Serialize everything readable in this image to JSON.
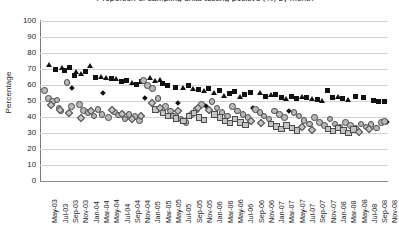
{
  "chart_data": {
    "type": "scatter",
    "title": "Proportion of sampling units testing positive (%) by month",
    "xlabel": "",
    "ylabel": "Percentage",
    "ylim": [
      0,
      100
    ],
    "ytick_step": 10,
    "yticks": [
      "100",
      "90",
      "80",
      "70",
      "60",
      "50",
      "40",
      "30",
      "20",
      "10",
      "0"
    ],
    "grid": true,
    "legend_position": "none",
    "x_range": [
      "May-03",
      "Nov-08"
    ],
    "xticks": [
      "May-03",
      "Jul-03",
      "Sep-03",
      "Nov-03",
      "Jan-04",
      "Mar-04",
      "May-04",
      "Jul-04",
      "Sep-04",
      "Nov-04",
      "Jan-05",
      "Mar-05",
      "May-05",
      "Jul-05",
      "Sep-05",
      "Nov-05",
      "Jan-06",
      "Mar-06",
      "May-06",
      "Jul-06",
      "Sep-06",
      "Nov-06",
      "Jan-07",
      "Mar-07",
      "May-07",
      "Jul-07",
      "Sep-07",
      "Nov-07",
      "Jan-08",
      "Mar-08",
      "May-08",
      "Jul-08",
      "Sep-08",
      "Nov-08"
    ],
    "series": [
      {
        "name": "series-triangle-black",
        "marker": "triangle",
        "color": "#111111",
        "points": [
          {
            "x": 1.0,
            "y": 72.0
          },
          {
            "x": 3.6,
            "y": 70.5
          },
          {
            "x": 6.3,
            "y": 68.0
          },
          {
            "x": 7.2,
            "y": 66.5
          },
          {
            "x": 9.0,
            "y": 71.5
          },
          {
            "x": 11.0,
            "y": 65.0
          },
          {
            "x": 12.0,
            "y": 64.0
          },
          {
            "x": 14.0,
            "y": 63.5
          },
          {
            "x": 17.0,
            "y": 61.0
          },
          {
            "x": 20.5,
            "y": 64.0
          },
          {
            "x": 21.5,
            "y": 62.5
          },
          {
            "x": 22.5,
            "y": 63.0
          },
          {
            "x": 27.0,
            "y": 58.0
          },
          {
            "x": 29.0,
            "y": 57.5
          },
          {
            "x": 31.0,
            "y": 56.0
          },
          {
            "x": 33.0,
            "y": 55.0
          },
          {
            "x": 35.0,
            "y": 53.0
          },
          {
            "x": 38.0,
            "y": 52.5
          },
          {
            "x": 42.0,
            "y": 55.0
          },
          {
            "x": 44.0,
            "y": 53.5
          },
          {
            "x": 47.0,
            "y": 51.0
          },
          {
            "x": 50.0,
            "y": 52.0
          },
          {
            "x": 52.0,
            "y": 51.0
          },
          {
            "x": 54.0,
            "y": 50.0
          },
          {
            "x": 57.0,
            "y": 52.5
          },
          {
            "x": 59.0,
            "y": 50.5
          }
        ]
      },
      {
        "name": "series-square-black",
        "marker": "square",
        "color": "#111111",
        "points": [
          {
            "x": 2.2,
            "y": 70.0
          },
          {
            "x": 4.0,
            "y": 69.0
          },
          {
            "x": 5.0,
            "y": 71.0
          },
          {
            "x": 6.0,
            "y": 66.0
          },
          {
            "x": 8.0,
            "y": 68.5
          },
          {
            "x": 10.0,
            "y": 65.0
          },
          {
            "x": 13.0,
            "y": 64.0
          },
          {
            "x": 15.0,
            "y": 62.0
          },
          {
            "x": 16.0,
            "y": 63.0
          },
          {
            "x": 18.0,
            "y": 60.5
          },
          {
            "x": 19.0,
            "y": 62.0
          },
          {
            "x": 23.0,
            "y": 61.0
          },
          {
            "x": 24.0,
            "y": 59.5
          },
          {
            "x": 25.5,
            "y": 58.5
          },
          {
            "x": 28.0,
            "y": 60.0
          },
          {
            "x": 30.0,
            "y": 57.0
          },
          {
            "x": 32.0,
            "y": 58.0
          },
          {
            "x": 34.0,
            "y": 56.5
          },
          {
            "x": 36.0,
            "y": 55.0
          },
          {
            "x": 37.0,
            "y": 56.0
          },
          {
            "x": 39.0,
            "y": 54.0
          },
          {
            "x": 40.0,
            "y": 55.5
          },
          {
            "x": 43.0,
            "y": 53.0
          },
          {
            "x": 45.0,
            "y": 54.0
          },
          {
            "x": 46.0,
            "y": 52.0
          },
          {
            "x": 48.0,
            "y": 53.0
          },
          {
            "x": 49.0,
            "y": 51.5
          },
          {
            "x": 51.0,
            "y": 52.5
          },
          {
            "x": 53.0,
            "y": 51.0
          },
          {
            "x": 55.0,
            "y": 56.5
          },
          {
            "x": 56.0,
            "y": 52.0
          },
          {
            "x": 58.0,
            "y": 51.5
          },
          {
            "x": 60.5,
            "y": 53.0
          },
          {
            "x": 62.0,
            "y": 52.0
          },
          {
            "x": 64.0,
            "y": 50.5
          },
          {
            "x": 65.0,
            "y": 50.0
          },
          {
            "x": 66.0,
            "y": 50.0
          }
        ]
      },
      {
        "name": "series-diamond-black",
        "marker": "diamond",
        "color": "#111111",
        "points": [
          {
            "x": 5.5,
            "y": 58.0
          },
          {
            "x": 11.5,
            "y": 55.0
          },
          {
            "x": 19.5,
            "y": 52.0
          },
          {
            "x": 26.0,
            "y": 49.0
          },
          {
            "x": 31.5,
            "y": 47.0
          },
          {
            "x": 40.5,
            "y": 45.5
          },
          {
            "x": 47.5,
            "y": 44.0
          },
          {
            "x": 66.5,
            "y": 37.0
          }
        ]
      },
      {
        "name": "series-circle-grey",
        "marker": "circle",
        "color": "#b8b8b8",
        "points": [
          {
            "x": 0.0,
            "y": 57.0
          },
          {
            "x": 0.8,
            "y": 52.0
          },
          {
            "x": 1.6,
            "y": 50.0
          },
          {
            "x": 2.4,
            "y": 51.0
          },
          {
            "x": 2.8,
            "y": 46.0
          },
          {
            "x": 3.2,
            "y": 44.0
          },
          {
            "x": 4.4,
            "y": 62.0
          },
          {
            "x": 5.2,
            "y": 47.0
          },
          {
            "x": 6.8,
            "y": 48.0
          },
          {
            "x": 7.6,
            "y": 44.5
          },
          {
            "x": 8.4,
            "y": 43.0
          },
          {
            "x": 9.6,
            "y": 41.0
          },
          {
            "x": 10.4,
            "y": 45.0
          },
          {
            "x": 11.2,
            "y": 42.0
          },
          {
            "x": 12.4,
            "y": 40.0
          },
          {
            "x": 13.6,
            "y": 43.5
          },
          {
            "x": 14.4,
            "y": 41.5
          },
          {
            "x": 15.6,
            "y": 39.0
          },
          {
            "x": 16.4,
            "y": 42.0
          },
          {
            "x": 17.6,
            "y": 40.5
          },
          {
            "x": 18.4,
            "y": 38.0
          },
          {
            "x": 19.2,
            "y": 63.0
          },
          {
            "x": 20.0,
            "y": 60.0
          },
          {
            "x": 21.0,
            "y": 58.0
          },
          {
            "x": 22.0,
            "y": 52.0
          },
          {
            "x": 23.5,
            "y": 47.0
          },
          {
            "x": 24.5,
            "y": 44.0
          },
          {
            "x": 25.0,
            "y": 41.0
          },
          {
            "x": 26.5,
            "y": 39.0
          },
          {
            "x": 27.5,
            "y": 37.0
          },
          {
            "x": 28.5,
            "y": 42.0
          },
          {
            "x": 29.5,
            "y": 45.0
          },
          {
            "x": 30.5,
            "y": 48.0
          },
          {
            "x": 32.5,
            "y": 50.0
          },
          {
            "x": 33.5,
            "y": 46.0
          },
          {
            "x": 34.5,
            "y": 43.0
          },
          {
            "x": 35.5,
            "y": 41.0
          },
          {
            "x": 36.5,
            "y": 47.0
          },
          {
            "x": 37.5,
            "y": 44.0
          },
          {
            "x": 38.5,
            "y": 42.0
          },
          {
            "x": 39.5,
            "y": 40.0
          },
          {
            "x": 41.0,
            "y": 45.0
          },
          {
            "x": 41.8,
            "y": 43.0
          },
          {
            "x": 42.6,
            "y": 41.0
          },
          {
            "x": 43.6,
            "y": 39.0
          },
          {
            "x": 44.6,
            "y": 44.0
          },
          {
            "x": 45.6,
            "y": 42.0
          },
          {
            "x": 46.6,
            "y": 40.0
          },
          {
            "x": 48.4,
            "y": 43.0
          },
          {
            "x": 49.4,
            "y": 41.0
          },
          {
            "x": 50.4,
            "y": 38.0
          },
          {
            "x": 51.4,
            "y": 36.0
          },
          {
            "x": 52.4,
            "y": 40.0
          },
          {
            "x": 53.4,
            "y": 37.0
          },
          {
            "x": 54.4,
            "y": 35.0
          },
          {
            "x": 55.4,
            "y": 39.0
          },
          {
            "x": 56.4,
            "y": 36.0
          },
          {
            "x": 57.4,
            "y": 34.0
          },
          {
            "x": 58.4,
            "y": 37.0
          },
          {
            "x": 59.4,
            "y": 35.0
          },
          {
            "x": 60.4,
            "y": 33.0
          },
          {
            "x": 61.4,
            "y": 36.0
          },
          {
            "x": 62.4,
            "y": 34.0
          },
          {
            "x": 63.4,
            "y": 35.5
          },
          {
            "x": 64.4,
            "y": 33.5
          },
          {
            "x": 65.4,
            "y": 37.0
          },
          {
            "x": 66.0,
            "y": 37.5
          }
        ]
      },
      {
        "name": "series-square-grey",
        "marker": "square-open",
        "color": "#c4c4c4",
        "points": [
          {
            "x": 21.5,
            "y": 45.0
          },
          {
            "x": 23.0,
            "y": 43.0
          },
          {
            "x": 24.0,
            "y": 41.0
          },
          {
            "x": 25.5,
            "y": 39.5
          },
          {
            "x": 27.0,
            "y": 38.0
          },
          {
            "x": 28.0,
            "y": 41.0
          },
          {
            "x": 29.0,
            "y": 43.0
          },
          {
            "x": 30.0,
            "y": 40.0
          },
          {
            "x": 31.0,
            "y": 38.5
          },
          {
            "x": 33.0,
            "y": 42.0
          },
          {
            "x": 34.0,
            "y": 40.0
          },
          {
            "x": 35.0,
            "y": 38.0
          },
          {
            "x": 36.0,
            "y": 36.5
          },
          {
            "x": 37.0,
            "y": 39.0
          },
          {
            "x": 38.0,
            "y": 37.0
          },
          {
            "x": 39.0,
            "y": 35.5
          },
          {
            "x": 44.0,
            "y": 36.0
          },
          {
            "x": 45.0,
            "y": 34.5
          },
          {
            "x": 46.0,
            "y": 33.0
          },
          {
            "x": 47.0,
            "y": 35.0
          },
          {
            "x": 48.0,
            "y": 33.5
          },
          {
            "x": 49.0,
            "y": 32.0
          },
          {
            "x": 55.0,
            "y": 33.0
          },
          {
            "x": 56.0,
            "y": 31.5
          },
          {
            "x": 57.0,
            "y": 33.5
          },
          {
            "x": 58.0,
            "y": 32.0
          },
          {
            "x": 59.0,
            "y": 30.5
          },
          {
            "x": 60.0,
            "y": 32.5
          }
        ]
      },
      {
        "name": "series-diamond-grey",
        "marker": "diamond-open",
        "color": "#c4c4c4",
        "points": [
          {
            "x": 1.2,
            "y": 48.0
          },
          {
            "x": 3.0,
            "y": 45.0
          },
          {
            "x": 4.8,
            "y": 43.0
          },
          {
            "x": 7.0,
            "y": 40.0
          },
          {
            "x": 9.0,
            "y": 44.0
          },
          {
            "x": 13.0,
            "y": 45.0
          },
          {
            "x": 15.0,
            "y": 42.0
          },
          {
            "x": 17.0,
            "y": 39.0
          },
          {
            "x": 18.8,
            "y": 41.0
          },
          {
            "x": 20.8,
            "y": 49.0
          },
          {
            "x": 22.5,
            "y": 46.0
          },
          {
            "x": 26.0,
            "y": 44.0
          },
          {
            "x": 29.8,
            "y": 46.0
          },
          {
            "x": 32.0,
            "y": 44.5
          },
          {
            "x": 40.0,
            "y": 38.0
          },
          {
            "x": 42.0,
            "y": 36.5
          },
          {
            "x": 50.0,
            "y": 34.0
          },
          {
            "x": 52.0,
            "y": 32.5
          },
          {
            "x": 61.0,
            "y": 31.0
          },
          {
            "x": 63.0,
            "y": 33.0
          }
        ]
      }
    ]
  }
}
